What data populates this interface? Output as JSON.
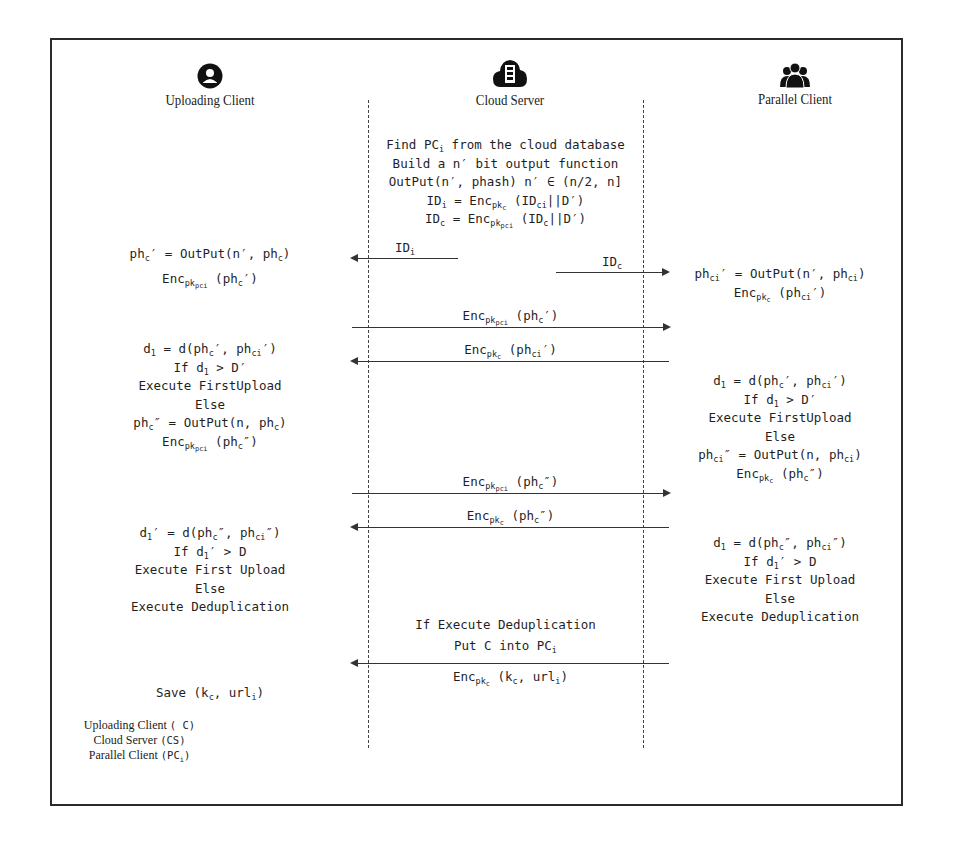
{
  "actors": {
    "uploading_client": {
      "label": "Uploading Client",
      "icon": "user-circle-icon"
    },
    "cloud_server": {
      "label": "Cloud Server",
      "icon": "cloud-server-icon"
    },
    "parallel_client": {
      "label": "Parallel Client",
      "icon": "user-group-icon"
    }
  },
  "server_setup": {
    "line1_pre": "Find PC",
    "line1_sub": "i",
    "line1_post": " from the cloud database",
    "line2": "Build a n′ bit output function",
    "line3": "OutPut(n′, phash) n′ ∈ (n/2, n]",
    "line4_pre": "ID",
    "line4_sub": "i",
    "line4_mid": " = Enc",
    "line4_sub2": "pk",
    "line4_sub3": "c",
    "line4_post": " (ID",
    "line4_sub4": "ci",
    "line4_end": "||D′)",
    "line5_pre": "ID",
    "line5_sub": "c",
    "line5_mid": " = Enc",
    "line5_sub2": "pk",
    "line5_sub3": "pci",
    "line5_post": " (ID",
    "line5_sub4": "c",
    "line5_end": "||D′)"
  },
  "messages": {
    "m1": {
      "pre": "ID",
      "sub": "i",
      "direction": "to-uploading-client"
    },
    "m2": {
      "pre": "ID",
      "sub": "c",
      "direction": "to-parallel-client"
    },
    "m3": {
      "pre": "Enc",
      "sub": "pk",
      "subsub": "pci",
      "post": " (ph",
      "sub2": "c",
      "end": "′)",
      "direction": "to-parallel-client"
    },
    "m4": {
      "pre": "Enc",
      "sub": "pk",
      "subsub": "c",
      "post": " (ph",
      "sub2": "ci",
      "end": "′)",
      "direction": "to-uploading-client"
    },
    "m5": {
      "pre": "Enc",
      "sub": "pk",
      "subsub": "pci",
      "post": " (ph",
      "sub2": "c",
      "end": "″)",
      "direction": "to-parallel-client"
    },
    "m6": {
      "pre": "Enc",
      "sub": "pk",
      "subsub": "c",
      "post": " (ph",
      "sub2": "c",
      "end": "″)",
      "direction": "to-uploading-client"
    },
    "m7": {
      "pre": "Enc",
      "sub": "pk",
      "subsub": "c",
      "post": " (k",
      "sub2": "c",
      "end": ", url",
      "sub3": "i",
      "end2": ")",
      "direction": "to-uploading-client"
    }
  },
  "uploading_client_steps": {
    "s1": "ph꜀′ = OutPut(n′, ph꜀)",
    "s1_parts": [
      "ph",
      "c",
      "′ = OutPut(n′, ph",
      "c",
      ")"
    ],
    "s2_parts": [
      "Enc",
      "pk",
      "pci",
      " (ph",
      "c",
      "′)"
    ],
    "b1": [
      "d",
      "1",
      " = d(ph",
      "c",
      "′, ph",
      "ci",
      "′)"
    ],
    "b2": [
      "If d",
      "1",
      " > D′"
    ],
    "b3": "Execute FirstUpload",
    "b4": "Else",
    "b5": [
      "ph",
      "c",
      "″ = OutPut(n, ph",
      "c",
      ")"
    ],
    "b6": [
      "Enc",
      "pk",
      "pci",
      " (ph",
      "c",
      "″)"
    ],
    "c1": [
      "d",
      "1",
      "′ = d(ph",
      "c",
      "″, ph",
      "ci",
      "″)"
    ],
    "c2": [
      "If d",
      "1",
      "′ > D"
    ],
    "c3": "Execute First Upload",
    "c4": "Else",
    "c5": "Execute Deduplication",
    "save": [
      "Save (k",
      "c",
      ", url",
      "i",
      ")"
    ]
  },
  "parallel_client_steps": {
    "s1": [
      "ph",
      "ci",
      "′ = OutPut(n′, ph",
      "ci",
      ")"
    ],
    "s2": [
      "Enc",
      "pk",
      "c",
      " (ph",
      "ci",
      "′)"
    ],
    "b1": [
      "d",
      "1",
      " = d(ph",
      "c",
      "′, ph",
      "ci",
      "′)"
    ],
    "b2": [
      "If d",
      "1",
      " > D′"
    ],
    "b3": "Execute FirstUpload",
    "b4": "Else",
    "b5": [
      "ph",
      "ci",
      "″ = OutPut(n, ph",
      "ci",
      ")"
    ],
    "b6": [
      "Enc",
      "pk",
      "c",
      " (ph",
      "c",
      "″)"
    ],
    "c1": [
      "d",
      "1",
      " = d(ph",
      "c",
      "″, ph",
      "ci",
      "″)"
    ],
    "c2": [
      "If d",
      "1",
      "′ > D"
    ],
    "c3": "Execute First Upload",
    "c4": "Else",
    "c5": "Execute Deduplication"
  },
  "server_dedup": {
    "line1": "If Execute Deduplication",
    "line2_pre": "Put C into PC",
    "line2_sub": "i"
  },
  "legend": {
    "l1_text": "Uploading Client ",
    "l1_code": "( C)",
    "l2_text": "Cloud Server ",
    "l2_code": "(CS)",
    "l3_text": "Parallel Client ",
    "l3_code_pre": "(PC",
    "l3_code_sub": "i",
    "l3_code_post": ")"
  }
}
